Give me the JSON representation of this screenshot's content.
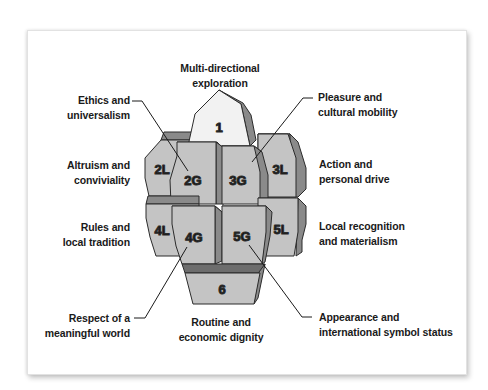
{
  "diagram": {
    "colors": {
      "front": "#c4c4c4",
      "top_face": "#f2f2f2",
      "side_face": "#8a8a8a",
      "shelf": "#7a7a7a",
      "outline": "#2b2b2b",
      "text": "#1a1a1a"
    },
    "blocks": [
      {
        "id": "1",
        "label": "1"
      },
      {
        "id": "2L",
        "label": "2L"
      },
      {
        "id": "2G",
        "label": "2G"
      },
      {
        "id": "3G",
        "label": "3G"
      },
      {
        "id": "3L",
        "label": "3L"
      },
      {
        "id": "4L",
        "label": "4L"
      },
      {
        "id": "4G",
        "label": "4G"
      },
      {
        "id": "5G",
        "label": "5G"
      },
      {
        "id": "5L",
        "label": "5L"
      },
      {
        "id": "6",
        "label": "6"
      }
    ],
    "labels": {
      "top": {
        "line1": "Multi-directional",
        "line2": "exploration"
      },
      "ethics": {
        "line1": "Ethics and",
        "line2": "universalism"
      },
      "pleasure": {
        "line1": "Pleasure and",
        "line2": "cultural mobility"
      },
      "altruism": {
        "line1": "Altruism and",
        "line2": "conviviality"
      },
      "action": {
        "line1": "Action and",
        "line2": "personal drive"
      },
      "rules": {
        "line1": "Rules and",
        "line2": "local tradition"
      },
      "local_recognition": {
        "line1": "Local recognition",
        "line2": "and materialism"
      },
      "respect": {
        "line1": "Respect of a",
        "line2": "meaningful world"
      },
      "routine": {
        "line1": "Routine and",
        "line2": "economic dignity"
      },
      "appearance": {
        "line1": "Appearance and",
        "line2": "international symbol status"
      }
    }
  }
}
